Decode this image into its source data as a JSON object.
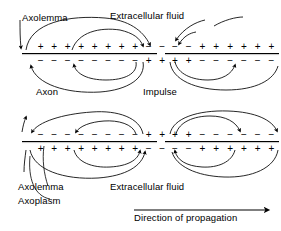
{
  "figure": {
    "type": "biology-diagram"
  },
  "labels": {
    "axolemma_top": "Axolemma",
    "extracellular_fluid_top": "Extracellular fluid",
    "axon": "Axon",
    "impulse": "Impulse",
    "axolemma_bottom": "Axolemma",
    "axoplasm": "Axoplasm",
    "extracellular_fluid_bottom": "Extracellular fluid",
    "direction_of_propagation": "Direction of propagation"
  },
  "symbols": {
    "plus": "+",
    "minus": "−"
  },
  "colors": {
    "ink": "#000000",
    "background": "#ffffff"
  },
  "panels": [
    {
      "id": "panel-top",
      "name": "upper-axon-panel",
      "description": "Resting membrane positive outside, negative inside, with two depolarized patches where polarity is reversed",
      "segments": [
        {
          "id": "top-left-outer",
          "side": "outside",
          "charges": [
            "+",
            "+",
            "+",
            "+",
            "+",
            "+",
            "+",
            "+",
            "−",
            "−"
          ]
        },
        {
          "id": "top-left-inner",
          "side": "inside",
          "charges": [
            "−",
            "−",
            "−",
            "−",
            "−",
            "−",
            "−",
            "−",
            "+",
            "+"
          ]
        },
        {
          "id": "top-right-outer",
          "side": "outside",
          "charges": [
            "−",
            "−",
            "+",
            "+",
            "+",
            "+",
            "+",
            "+"
          ]
        },
        {
          "id": "top-right-inner",
          "side": "inside",
          "charges": [
            "+",
            "+",
            "−",
            "−",
            "−",
            "−",
            "−",
            "−"
          ]
        }
      ]
    },
    {
      "id": "panel-bottom",
      "name": "lower-axon-panel",
      "description": "Same axon a moment later; impulse has advanced and polarity pattern is inverted relative to upper panel",
      "segments": [
        {
          "id": "bottom-left-outer",
          "side": "outside",
          "charges": [
            "−",
            "−",
            "−",
            "−",
            "−",
            "−",
            "−",
            "−",
            "+",
            "+"
          ]
        },
        {
          "id": "bottom-left-inner",
          "side": "inside",
          "charges": [
            "+",
            "+",
            "+",
            "+",
            "+",
            "+",
            "+",
            "+",
            "−",
            "−"
          ]
        },
        {
          "id": "bottom-right-outer",
          "side": "outside",
          "charges": [
            "+",
            "+",
            "−",
            "−",
            "−",
            "−",
            "−",
            "−"
          ]
        },
        {
          "id": "bottom-right-inner",
          "side": "inside",
          "charges": [
            "−",
            "−",
            "+",
            "+",
            "+",
            "+",
            "+",
            "+"
          ]
        }
      ]
    }
  ]
}
